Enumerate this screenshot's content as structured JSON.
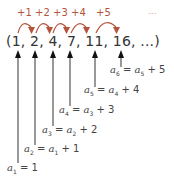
{
  "colors": {
    "arc": "#b5533c",
    "arrow": "#222222",
    "text": "#333333",
    "ellipsis": "#e8a090"
  },
  "increments": [
    "+1",
    "+2",
    "+3",
    "+4",
    "+5"
  ],
  "increments_ellipsis": "...",
  "sequence": {
    "text": "(1, 2, 4, 7, 11, 16, ...)",
    "terms": [
      "1",
      "2",
      "4",
      "7",
      "11",
      "16"
    ]
  },
  "equations": [
    {
      "lhs": "a",
      "lhs_sub": "1",
      "rest": " = 1",
      "rhs_var": "",
      "rhs_sub": "",
      "tail": ""
    },
    {
      "lhs": "a",
      "lhs_sub": "2",
      "rest": " = ",
      "rhs_var": "a",
      "rhs_sub": "1",
      "tail": " + 1"
    },
    {
      "lhs": "a",
      "lhs_sub": "3",
      "rest": " = ",
      "rhs_var": "a",
      "rhs_sub": "2",
      "tail": " + 2"
    },
    {
      "lhs": "a",
      "lhs_sub": "4",
      "rest": " = ",
      "rhs_var": "a",
      "rhs_sub": "3",
      "tail": " + 3"
    },
    {
      "lhs": "a",
      "lhs_sub": "5",
      "rest": " = ",
      "rhs_var": "a",
      "rhs_sub": "4",
      "tail": " + 4"
    },
    {
      "lhs": "a",
      "lhs_sub": "6",
      "rest": " = ",
      "rhs_var": "a",
      "rhs_sub": "5",
      "tail": " + 5"
    }
  ]
}
